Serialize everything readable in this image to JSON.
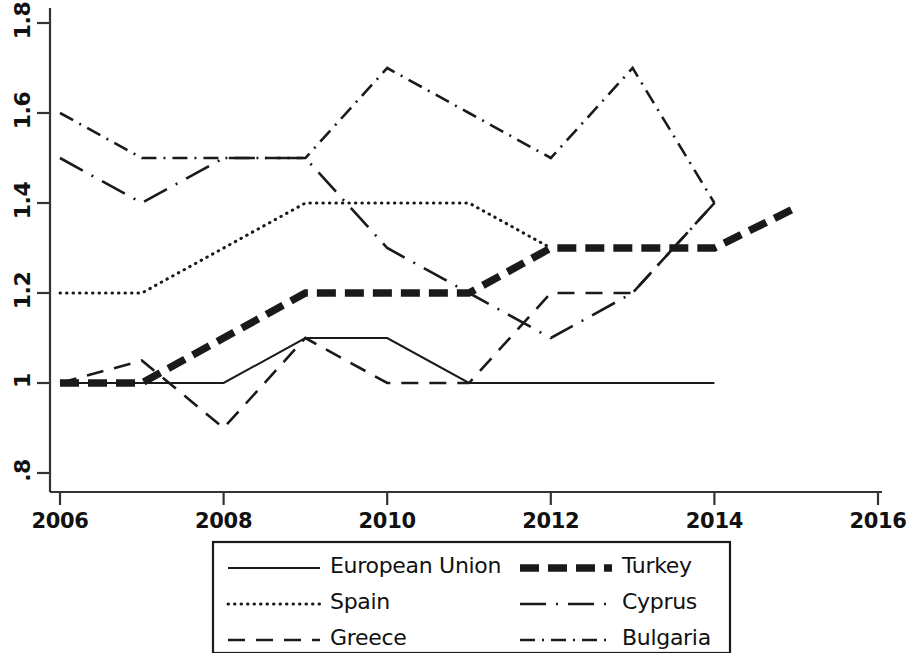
{
  "chart_data": {
    "type": "line",
    "title": "",
    "subtitle": "",
    "xlabel": "",
    "ylabel": "",
    "xlim": [
      2005.6,
      2016.3
    ],
    "ylim": [
      0.77,
      1.82
    ],
    "grid": false,
    "legend_position": "bottom",
    "x_ticks": [
      "2006",
      "2008",
      "2010",
      "2012",
      "2014",
      "2016"
    ],
    "x_tick_values": [
      2006,
      2008,
      2010,
      2012,
      2014,
      2016
    ],
    "y_ticks": [
      ".8",
      "1",
      "1.2",
      "1.4",
      "1.6",
      "1.8"
    ],
    "y_tick_values": [
      0.8,
      1.0,
      1.2,
      1.4,
      1.6,
      1.8
    ],
    "x": [
      2006,
      2007,
      2008,
      2009,
      2010,
      2011,
      2012,
      2013,
      2014,
      2015
    ],
    "series": [
      {
        "name": "European Union",
        "style": "solid",
        "x": [
          2006,
          2007,
          2008,
          2009,
          2010,
          2011,
          2012,
          2013,
          2014
        ],
        "values": [
          1.0,
          1.0,
          1.0,
          1.1,
          1.1,
          1.0,
          1.0,
          1.0,
          1.0
        ]
      },
      {
        "name": "Spain",
        "style": "dotted",
        "x": [
          2006,
          2007,
          2008,
          2009,
          2010,
          2011,
          2012
        ],
        "values": [
          1.2,
          1.2,
          1.3,
          1.4,
          1.4,
          1.4,
          1.3
        ]
      },
      {
        "name": "Greece",
        "style": "dashed",
        "x": [
          2006,
          2007,
          2008,
          2009,
          2010,
          2011,
          2012,
          2013,
          2014
        ],
        "values": [
          1.0,
          1.05,
          0.9,
          1.1,
          1.0,
          1.0,
          1.2,
          1.2,
          1.4
        ]
      },
      {
        "name": "Turkey",
        "style": "thick-dashed",
        "x": [
          2006,
          2007,
          2008,
          2009,
          2010,
          2011,
          2012,
          2013,
          2014,
          2015
        ],
        "values": [
          1.0,
          1.0,
          1.1,
          1.2,
          1.2,
          1.2,
          1.3,
          1.3,
          1.3,
          1.39
        ]
      },
      {
        "name": "Cyprus",
        "style": "long-dash-dot",
        "x": [
          2006,
          2007,
          2008,
          2009,
          2010,
          2011,
          2012,
          2013,
          2014
        ],
        "values": [
          1.5,
          1.4,
          1.5,
          1.5,
          1.3,
          1.2,
          1.1,
          1.2,
          1.4
        ]
      },
      {
        "name": "Bulgaria",
        "style": "dash-dot",
        "x": [
          2006,
          2007,
          2008,
          2009,
          2010,
          2011,
          2012,
          2013,
          2014
        ],
        "values": [
          1.6,
          1.5,
          1.5,
          1.5,
          1.7,
          1.6,
          1.5,
          1.7,
          1.4
        ]
      }
    ]
  },
  "legend": {
    "entries": [
      {
        "label": "European Union",
        "style": "solid"
      },
      {
        "label": "Turkey",
        "style": "thick-dashed"
      },
      {
        "label": "Spain",
        "style": "dotted"
      },
      {
        "label": "Cyprus",
        "style": "long-dash-dot"
      },
      {
        "label": "Greece",
        "style": "dashed"
      },
      {
        "label": "Bulgaria",
        "style": "dash-dot"
      }
    ]
  },
  "colors": {
    "line": "#1a1a1a",
    "axis": "#333333",
    "background": "#ffffff"
  }
}
